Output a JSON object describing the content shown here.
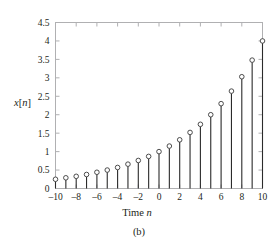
{
  "figure": {
    "caption": "(b)"
  },
  "chart_data": {
    "type": "scatter",
    "plot_style": "stem",
    "title": "",
    "xlabel": "Time n",
    "xlabel_plain": "Time",
    "xlabel_italic_symbol": "n",
    "ylabel": "x[n]",
    "ylabel_italic_x": "x",
    "ylabel_bracket_open": "[",
    "ylabel_italic_n": "n",
    "ylabel_bracket_close": "]",
    "xlim": [
      -10,
      10
    ],
    "ylim": [
      0,
      4.5
    ],
    "grid": false,
    "legend": null,
    "xticks": [
      -10,
      -8,
      -6,
      -4,
      -2,
      0,
      2,
      4,
      6,
      8,
      10
    ],
    "xtick_labels": [
      "–10",
      "–8",
      "–6",
      "–4",
      "–2",
      "0",
      "2",
      "4",
      "6",
      "8",
      "10"
    ],
    "xminor_ticks": [
      -9,
      -7,
      -5,
      -3,
      -1,
      1,
      3,
      5,
      7,
      9
    ],
    "yticks": [
      0,
      0.5,
      1,
      1.5,
      2,
      2.5,
      3,
      3.5,
      4,
      4.5
    ],
    "ytick_labels": [
      "0",
      "0.5",
      "1",
      "1.5",
      "2",
      "2.5",
      "3",
      "3.5",
      "4",
      "4.5"
    ],
    "x": [
      -10,
      -9,
      -8,
      -7,
      -6,
      -5,
      -4,
      -3,
      -2,
      -1,
      0,
      1,
      2,
      3,
      4,
      5,
      6,
      7,
      8,
      9,
      10
    ],
    "values": [
      0.25,
      0.29,
      0.33,
      0.38,
      0.44,
      0.5,
      0.57,
      0.66,
      0.76,
      0.87,
      1.0,
      1.15,
      1.32,
      1.52,
      1.74,
      2.0,
      2.3,
      2.64,
      3.03,
      3.48,
      4.0
    ],
    "marker": "open-circle",
    "marker_facecolor": "#ffffff",
    "marker_edgecolor": "#3a3a3a",
    "stem_color": "#2b2b2b",
    "frame_color": "#b0b0b2",
    "baseline": 0
  }
}
